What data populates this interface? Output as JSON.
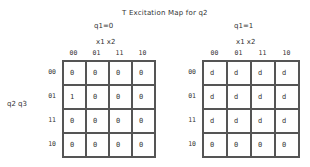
{
  "title": "T Excitation Map for q2",
  "row_variable_label": "q2 q3",
  "maps": [
    {
      "condition": "q1=0",
      "column_variable_label": "x1 x2",
      "column_headers": [
        "00",
        "01",
        "11",
        "10"
      ],
      "row_headers": [
        "00",
        "01",
        "11",
        "10"
      ],
      "cells": [
        [
          "0",
          "0",
          "0",
          "0"
        ],
        [
          "1",
          "0",
          "0",
          "0"
        ],
        [
          "0",
          "0",
          "0",
          "0"
        ],
        [
          "0",
          "0",
          "0",
          "0"
        ]
      ]
    },
    {
      "condition": "q1=1",
      "column_variable_label": "x1 x2",
      "column_headers": [
        "00",
        "01",
        "11",
        "10"
      ],
      "row_headers": [
        "00",
        "01",
        "11",
        "10"
      ],
      "cells": [
        [
          "d",
          "d",
          "d",
          "d"
        ],
        [
          "d",
          "d",
          "d",
          "d"
        ],
        [
          "d",
          "d",
          "d",
          "d"
        ],
        [
          "0",
          "0",
          "0",
          "0"
        ]
      ]
    }
  ]
}
